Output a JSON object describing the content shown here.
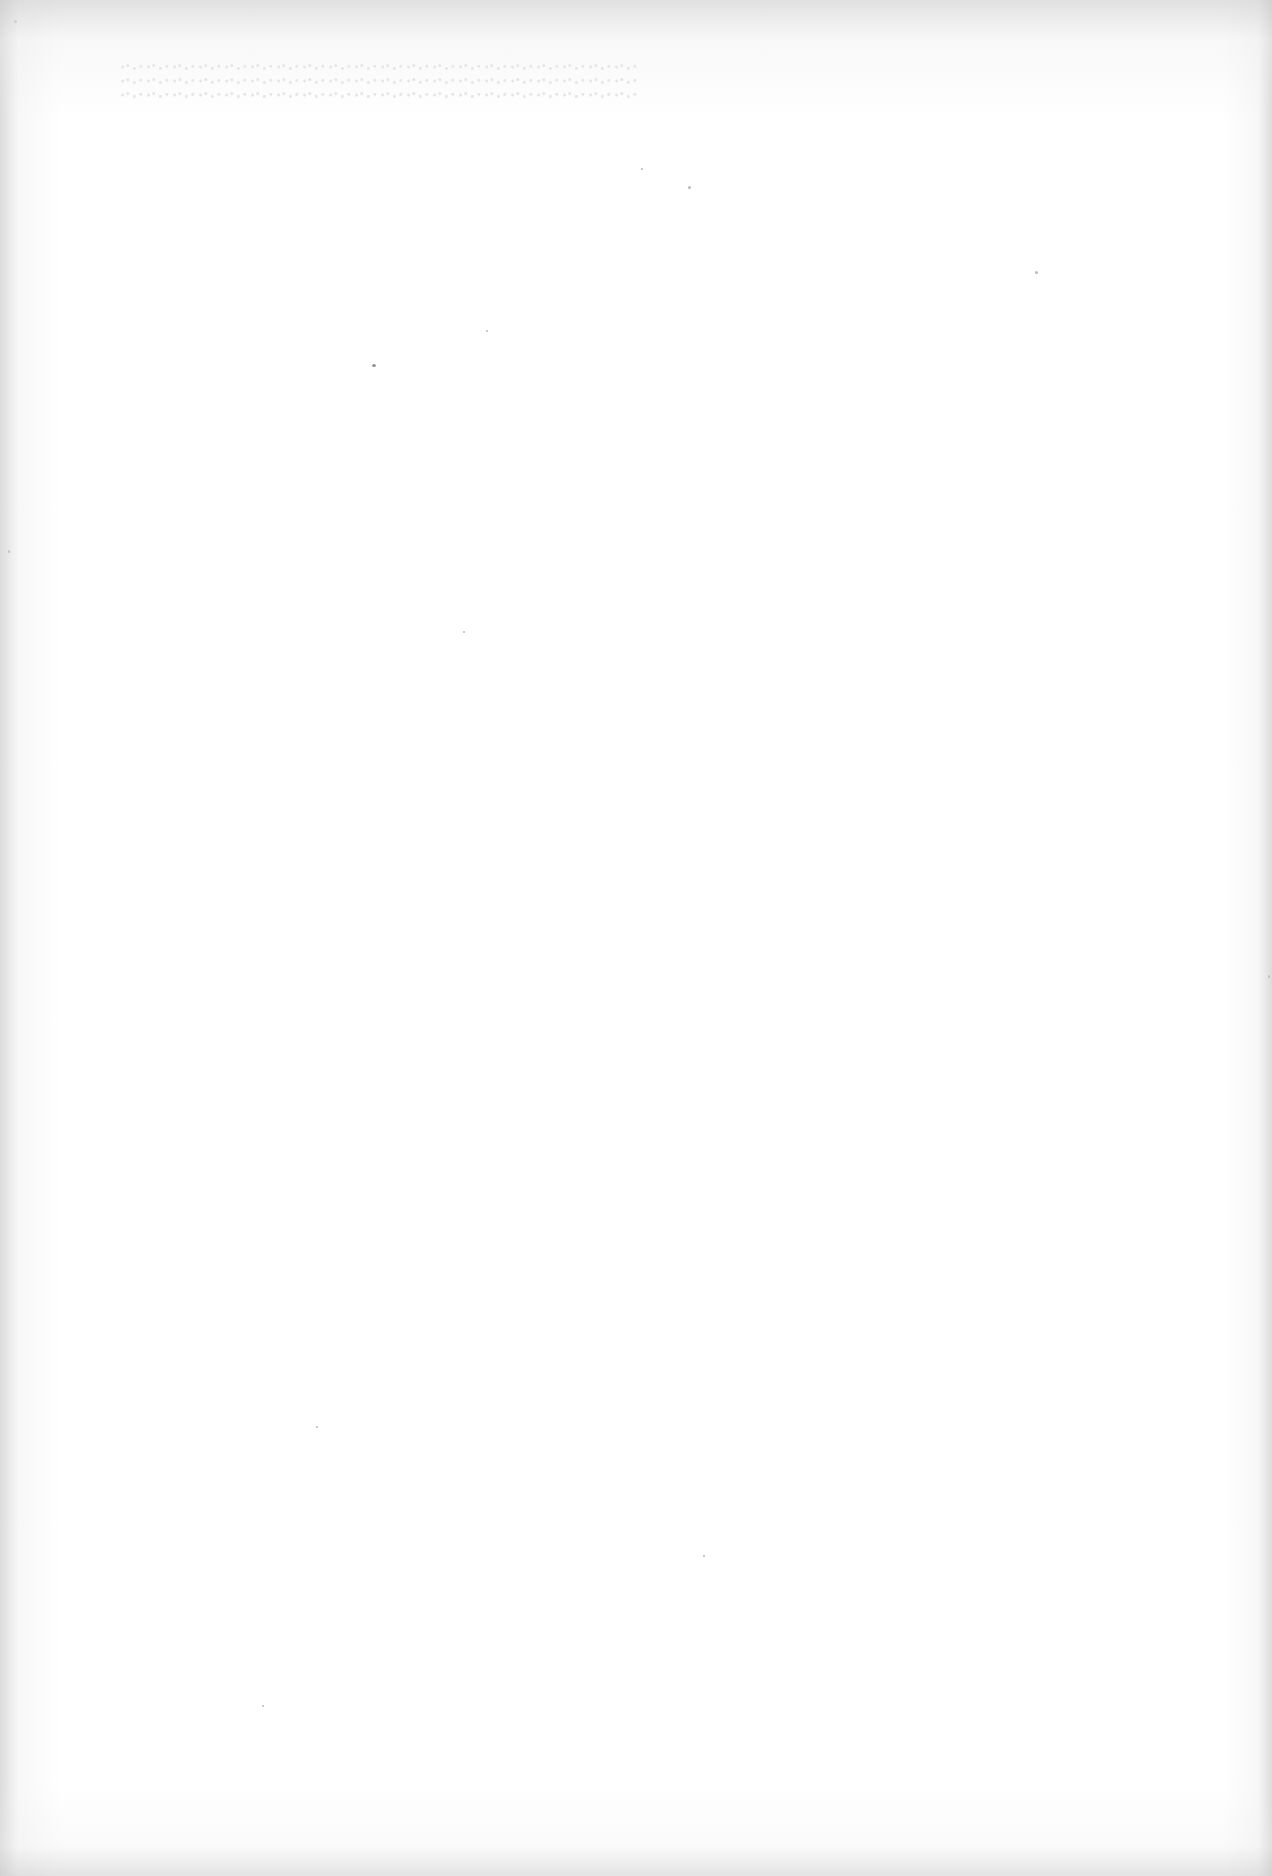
{
  "page": {
    "type": "blank-scanned-page",
    "text_content": "",
    "background_color": "#ffffff",
    "edge_shade_color": "#c8c8c8",
    "speck_color": "#8a8a8a"
  }
}
